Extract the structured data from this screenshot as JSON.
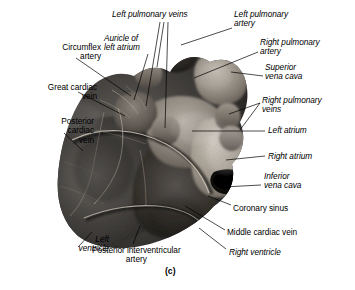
{
  "figure": {
    "caption": "(c)",
    "specimen_description": "posterior-heart-photograph",
    "background_color": "#ffffff",
    "ink_color": "#000000"
  },
  "labels": [
    {
      "id": "left-pulmonary-veins",
      "text": "Left pulmonary veins",
      "style": "italic",
      "align": "left",
      "x": 112,
      "y": 10
    },
    {
      "id": "left-pulmonary-artery",
      "text": "Left pulmonary\nartery",
      "style": "italic",
      "align": "left",
      "x": 234,
      "y": 10
    },
    {
      "id": "auricle-of-left-atrium",
      "text": "Auricle of\nleft atrium",
      "style": "italic",
      "align": "left",
      "x": 104,
      "y": 34
    },
    {
      "id": "right-pulmonary-artery",
      "text": "Right pulmonary\nartery",
      "style": "italic",
      "align": "left",
      "x": 260,
      "y": 38
    },
    {
      "id": "circumflex-artery",
      "text": "Circumflex\nartery",
      "style": "normal",
      "align": "right",
      "x": 17,
      "y": 43
    },
    {
      "id": "superior-vena-cava",
      "text": "Superior\nvena cava",
      "style": "italic",
      "align": "left",
      "x": 265,
      "y": 63
    },
    {
      "id": "great-cardiac-vein",
      "text": "Great cardiac\nvein",
      "style": "normal",
      "align": "right",
      "x": 13,
      "y": 83
    },
    {
      "id": "right-pulmonary-veins",
      "text": "Right pulmonary\nveins",
      "style": "italic",
      "align": "left",
      "x": 262,
      "y": 96
    },
    {
      "id": "posterior-cardiac-vein",
      "text": "Posterior\ncardiac\nvein",
      "style": "normal",
      "align": "right",
      "x": 10,
      "y": 117
    },
    {
      "id": "left-atrium",
      "text": "Left atrium",
      "style": "italic",
      "align": "left",
      "x": 268,
      "y": 126
    },
    {
      "id": "right-atrium",
      "text": "Right atrium",
      "style": "italic",
      "align": "left",
      "x": 268,
      "y": 152
    },
    {
      "id": "inferior-vena-cava",
      "text": "Inferior\nvena cava",
      "style": "italic",
      "align": "left",
      "x": 264,
      "y": 172
    },
    {
      "id": "coronary-sinus",
      "text": "Coronary sinus",
      "style": "normal",
      "align": "left",
      "x": 233,
      "y": 204
    },
    {
      "id": "middle-cardiac-vein",
      "text": "Middle cardiac vein",
      "style": "normal",
      "align": "left",
      "x": 227,
      "y": 228
    },
    {
      "id": "left-ventricle",
      "text": "Left\nventricle",
      "style": "italic",
      "align": "right",
      "x": 25,
      "y": 235
    },
    {
      "id": "posterior-interventricular-artery",
      "text": "Posterior interventricular\nartery",
      "style": "normal",
      "align": "center",
      "x": 92,
      "y": 246
    },
    {
      "id": "right-ventricle",
      "text": "Right ventricle",
      "style": "italic",
      "align": "left",
      "x": 229,
      "y": 248
    }
  ],
  "leader_lines": [
    {
      "label": "left-pulmonary-veins-a",
      "points": "160,22 146,106"
    },
    {
      "label": "left-pulmonary-veins-b",
      "points": "164,22 157,67"
    },
    {
      "label": "left-pulmonary-veins-c",
      "points": "168,22 165,128"
    },
    {
      "label": "left-pulmonary-artery",
      "points": "232,28 181,45"
    },
    {
      "label": "auricle-of-left-atrium",
      "points": "148,54 134,100"
    },
    {
      "label": "right-pulmonary-artery",
      "points": "258,52 194,78"
    },
    {
      "label": "circumflex-artery",
      "points": "76,58 131,96"
    },
    {
      "label": "superior-vena-cava",
      "points": "263,76 231,72"
    },
    {
      "label": "great-cardiac-vein",
      "points": "78,92 125,116"
    },
    {
      "label": "right-pulmonary-veins-a",
      "points": "260,103 229,114"
    },
    {
      "label": "right-pulmonary-veins-b",
      "points": "260,103 240,130"
    },
    {
      "label": "posterior-cardiac-vein",
      "points": "64,133 83,151"
    },
    {
      "label": "left-atrium",
      "points": "265,131 192,131"
    },
    {
      "label": "right-atrium",
      "points": "265,156 226,160"
    },
    {
      "label": "inferior-vena-cava",
      "points": "261,185 223,187"
    },
    {
      "label": "coronary-sinus",
      "points": "231,205 208,196"
    },
    {
      "label": "middle-cardiac-vein",
      "points": "225,230 185,206"
    },
    {
      "label": "left-ventricle",
      "points": "78,247 92,232"
    },
    {
      "label": "posterior-interventricular-artery",
      "points": "133,244 140,226"
    },
    {
      "label": "right-ventricle",
      "points": "226,249 199,228"
    }
  ]
}
